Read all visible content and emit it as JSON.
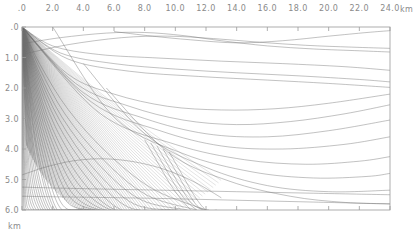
{
  "figure": {
    "title": "",
    "background_color": "#ffffff",
    "frame_color": "#9a9a9a",
    "ray_color": "#6e6e6e"
  },
  "axes": {
    "x_axis": {
      "name": "distance",
      "unit": "km",
      "unit_label": "km",
      "position": "top",
      "min": 0.0,
      "max": 24.0,
      "tick_step": 2.0,
      "tick_labels": [
        ".0",
        "2.0",
        "4.0",
        "6.0",
        "8.0",
        "10.0",
        "12.0",
        "14.0",
        "16.0",
        "18.0",
        "20.0",
        "22.0",
        "24.0"
      ],
      "tick_values": [
        0,
        2,
        4,
        6,
        8,
        10,
        12,
        14,
        16,
        18,
        20,
        22,
        24
      ]
    },
    "y_axis": {
      "name": "depth",
      "unit": "km",
      "unit_label": "km",
      "position": "left",
      "direction": "down",
      "min": 0.0,
      "max": 6.0,
      "tick_step": 1.0,
      "tick_labels": [
        ".0",
        "1.0",
        "2.0",
        "3.0",
        "4.0",
        "5.0",
        "6.0"
      ],
      "tick_values": [
        0,
        1,
        2,
        3,
        4,
        5,
        6
      ]
    }
  },
  "chart_data": {
    "type": "line",
    "title": "",
    "xlabel": "km",
    "ylabel": "km",
    "xlim": [
      0.0,
      24.0
    ],
    "ylim": [
      0.0,
      6.0
    ],
    "y_inverted": true,
    "grid": false,
    "legend": "none",
    "source": {
      "x": 0.0,
      "y": 0.0
    },
    "series": [
      {
        "name": "direct-fan-ray-01",
        "x": [
          0,
          1.2,
          3.0,
          5.5,
          8.5,
          12.0
        ],
        "y": [
          0,
          1.25,
          2.7,
          4.1,
          5.3,
          6.0
        ]
      },
      {
        "name": "direct-fan-ray-02",
        "x": [
          0,
          1.1,
          2.8,
          5.2,
          8.1,
          11.4
        ],
        "y": [
          0,
          1.3,
          2.85,
          4.3,
          5.5,
          6.0
        ]
      },
      {
        "name": "direct-fan-ray-03",
        "x": [
          0,
          1.0,
          2.6,
          4.9,
          7.7,
          10.8
        ],
        "y": [
          0,
          1.35,
          2.95,
          4.45,
          5.65,
          6.0
        ]
      },
      {
        "name": "direct-fan-ray-04",
        "x": [
          0,
          0.95,
          2.45,
          4.6,
          7.3,
          10.2
        ],
        "y": [
          0,
          1.4,
          3.05,
          4.6,
          5.8,
          6.0
        ]
      },
      {
        "name": "direct-fan-ray-05",
        "x": [
          0,
          0.9,
          2.3,
          4.35,
          6.9,
          9.7
        ],
        "y": [
          0,
          1.45,
          3.15,
          4.7,
          5.9,
          6.0
        ]
      },
      {
        "name": "direct-fan-ray-06",
        "x": [
          0,
          0.85,
          2.15,
          4.1,
          6.5,
          9.2
        ],
        "y": [
          0,
          1.5,
          3.25,
          4.85,
          6.0,
          6.0
        ]
      },
      {
        "name": "direct-fan-ray-07",
        "x": [
          0,
          0.8,
          2.0,
          3.85,
          6.1,
          8.7
        ],
        "y": [
          0,
          1.55,
          3.35,
          5.0,
          6.0,
          6.0
        ]
      },
      {
        "name": "direct-fan-ray-08",
        "x": [
          0,
          0.75,
          1.9,
          3.6,
          5.8,
          8.2
        ],
        "y": [
          0,
          1.6,
          3.45,
          5.1,
          6.0,
          6.0
        ]
      },
      {
        "name": "direct-fan-ray-09",
        "x": [
          0,
          0.7,
          1.8,
          3.4,
          5.4,
          7.7
        ],
        "y": [
          0,
          1.65,
          3.55,
          5.25,
          6.0,
          6.0
        ]
      },
      {
        "name": "direct-fan-ray-10",
        "x": [
          0,
          0.65,
          1.7,
          3.2,
          5.1,
          7.2
        ],
        "y": [
          0,
          1.7,
          3.65,
          5.4,
          6.0,
          6.0
        ]
      },
      {
        "name": "direct-fan-ray-11",
        "x": [
          0,
          0.6,
          1.6,
          3.0,
          4.8,
          6.8
        ],
        "y": [
          0,
          1.75,
          3.75,
          5.5,
          6.0,
          6.0
        ]
      },
      {
        "name": "direct-fan-ray-12",
        "x": [
          0,
          0.55,
          1.5,
          2.8,
          4.5,
          6.3
        ],
        "y": [
          0,
          1.8,
          3.85,
          5.65,
          6.0,
          6.0
        ]
      },
      {
        "name": "direct-fan-ray-13",
        "x": [
          0,
          0.5,
          1.4,
          2.6,
          4.2,
          5.9
        ],
        "y": [
          0,
          1.85,
          3.95,
          5.8,
          6.0,
          6.0
        ]
      },
      {
        "name": "direct-fan-ray-14",
        "x": [
          0,
          0.48,
          1.3,
          2.45,
          3.9,
          5.5
        ],
        "y": [
          0,
          1.9,
          4.05,
          5.9,
          6.0,
          6.0
        ]
      },
      {
        "name": "direct-fan-ray-15",
        "x": [
          0,
          0.45,
          1.2,
          2.3,
          3.65,
          5.1
        ],
        "y": [
          0,
          1.95,
          4.15,
          6.0,
          6.0,
          6.0
        ]
      },
      {
        "name": "direct-fan-ray-16",
        "x": [
          0,
          0.42,
          1.1,
          2.15,
          3.4,
          4.8
        ],
        "y": [
          0,
          2.0,
          4.25,
          6.0,
          6.0,
          6.0
        ]
      },
      {
        "name": "direct-fan-ray-17",
        "x": [
          0,
          0.4,
          1.05,
          2.0,
          3.2,
          4.5
        ],
        "y": [
          0,
          2.05,
          4.35,
          6.0,
          6.0,
          6.0
        ]
      },
      {
        "name": "direct-fan-ray-18",
        "x": [
          0,
          0.36,
          0.95,
          1.85,
          2.95,
          4.15
        ],
        "y": [
          0,
          2.1,
          4.5,
          6.0,
          6.0,
          6.0
        ]
      },
      {
        "name": "direct-fan-ray-19",
        "x": [
          0,
          0.33,
          0.88,
          1.7,
          2.7,
          3.85
        ],
        "y": [
          0,
          2.15,
          4.6,
          6.0,
          6.0,
          6.0
        ]
      },
      {
        "name": "direct-fan-ray-20",
        "x": [
          0,
          0.3,
          0.8,
          1.55,
          2.5,
          3.55
        ],
        "y": [
          0,
          2.2,
          4.7,
          6.0,
          6.0,
          6.0
        ]
      },
      {
        "name": "direct-fan-ray-21",
        "x": [
          0,
          0.27,
          0.72,
          1.4,
          2.25,
          3.2
        ],
        "y": [
          0,
          2.25,
          4.8,
          6.0,
          6.0,
          6.0
        ]
      },
      {
        "name": "direct-fan-ray-22",
        "x": [
          0,
          0.24,
          0.64,
          1.25,
          2.0,
          2.85
        ],
        "y": [
          0,
          2.3,
          4.9,
          6.0,
          6.0,
          6.0
        ]
      },
      {
        "name": "direct-fan-ray-23",
        "x": [
          0,
          0.2,
          0.55,
          1.1,
          1.75,
          2.5
        ],
        "y": [
          0,
          2.35,
          5.0,
          6.0,
          6.0,
          6.0
        ]
      },
      {
        "name": "direct-fan-ray-24",
        "x": [
          0,
          0.17,
          0.47,
          0.93,
          1.5,
          2.15
        ],
        "y": [
          0,
          2.4,
          5.1,
          6.0,
          6.0,
          6.0
        ]
      },
      {
        "name": "direct-fan-ray-25",
        "x": [
          0,
          0.14,
          0.39,
          0.78,
          1.25,
          1.8
        ],
        "y": [
          0,
          2.45,
          5.2,
          6.0,
          6.0,
          6.0
        ]
      },
      {
        "name": "direct-fan-ray-26",
        "x": [
          0,
          0.11,
          0.31,
          0.62,
          1.0,
          1.45
        ],
        "y": [
          0,
          2.5,
          5.3,
          6.0,
          6.0,
          6.0
        ]
      },
      {
        "name": "direct-fan-ray-27",
        "x": [
          0,
          0.08,
          0.23,
          0.46,
          0.75,
          1.1
        ],
        "y": [
          0,
          2.55,
          5.4,
          6.0,
          6.0,
          6.0
        ]
      },
      {
        "name": "direct-fan-ray-28",
        "x": [
          0,
          0.06,
          0.17,
          0.34,
          0.55,
          0.8
        ],
        "y": [
          0,
          2.6,
          5.5,
          6.0,
          6.0,
          6.0
        ]
      },
      {
        "name": "direct-fan-ray-29",
        "x": [
          0,
          0.04,
          0.11,
          0.22,
          0.36,
          0.52
        ],
        "y": [
          0,
          2.65,
          5.6,
          6.0,
          6.0,
          6.0
        ]
      },
      {
        "name": "direct-fan-ray-30",
        "x": [
          0,
          0.02,
          0.06,
          0.12,
          0.2,
          0.28
        ],
        "y": [
          0,
          2.7,
          5.7,
          6.0,
          6.0,
          6.0
        ]
      },
      {
        "name": "turning-ray-shallow-01",
        "x": [
          0,
          2.0,
          5.0,
          9.0,
          13.0,
          17.0,
          21.0,
          24.0
        ],
        "y": [
          0,
          0.62,
          0.9,
          1.02,
          1.12,
          1.2,
          1.3,
          1.42
        ]
      },
      {
        "name": "turning-ray-shallow-02",
        "x": [
          0,
          2.5,
          6.0,
          10.0,
          14.0,
          18.0,
          22.0,
          24.0
        ],
        "y": [
          0,
          0.85,
          1.2,
          1.38,
          1.5,
          1.6,
          1.72,
          1.8
        ]
      },
      {
        "name": "turning-ray-shallow-03",
        "x": [
          0,
          3.0,
          7.0,
          11.5,
          16.0,
          20.0,
          24.0
        ],
        "y": [
          0,
          1.05,
          1.45,
          1.62,
          1.74,
          1.85,
          1.98
        ]
      },
      {
        "name": "reflected-arc-01",
        "x": [
          0,
          2.5,
          5.5,
          8.0,
          10.5,
          13.0,
          16.0,
          19.0,
          22.0,
          24.0
        ],
        "y": [
          0.55,
          0.35,
          0.2,
          0.18,
          0.28,
          0.45,
          0.62,
          0.72,
          0.78,
          0.82
        ]
      },
      {
        "name": "reflected-arc-02",
        "x": [
          0,
          3.0,
          6.5,
          9.5,
          12.5,
          15.5,
          18.5,
          21.5,
          24.0
        ],
        "y": [
          0.9,
          0.58,
          0.35,
          0.3,
          0.38,
          0.5,
          0.6,
          0.66,
          0.7
        ]
      },
      {
        "name": "reflected-arc-03",
        "x": [
          6.0,
          8.5,
          11.0,
          14.0,
          17.0,
          20.0,
          22.5,
          24.0
        ],
        "y": [
          0.15,
          0.3,
          0.42,
          0.52,
          0.45,
          0.3,
          0.18,
          0.12
        ]
      },
      {
        "name": "deep-turning-ray-01",
        "x": [
          0,
          3.0,
          6.0,
          9.5,
          13.0,
          16.5,
          20.0,
          24.0
        ],
        "y": [
          0,
          1.55,
          2.2,
          2.6,
          2.72,
          2.68,
          2.5,
          2.2
        ]
      },
      {
        "name": "deep-turning-ray-02",
        "x": [
          0,
          3.5,
          7.0,
          10.5,
          14.0,
          17.5,
          21.0,
          24.0
        ],
        "y": [
          0,
          1.85,
          2.6,
          3.05,
          3.2,
          3.1,
          2.85,
          2.55
        ]
      },
      {
        "name": "deep-turning-ray-03",
        "x": [
          0,
          4.0,
          8.0,
          12.0,
          16.0,
          20.0,
          24.0
        ],
        "y": [
          0,
          2.15,
          3.0,
          3.5,
          3.6,
          3.4,
          3.05
        ]
      },
      {
        "name": "deep-turning-ray-04",
        "x": [
          0,
          4.5,
          9.0,
          13.0,
          17.0,
          21.0,
          24.0
        ],
        "y": [
          0,
          2.45,
          3.4,
          3.9,
          4.0,
          3.85,
          3.6
        ]
      },
      {
        "name": "deep-turning-ray-05",
        "x": [
          0,
          5.0,
          10.0,
          14.5,
          18.5,
          22.0,
          24.0
        ],
        "y": [
          0,
          2.8,
          3.85,
          4.35,
          4.5,
          4.4,
          4.25
        ]
      },
      {
        "name": "deep-turning-ray-06",
        "x": [
          2.0,
          6.0,
          10.5,
          15.0,
          19.0,
          22.5,
          24.0
        ],
        "y": [
          0,
          2.95,
          4.15,
          4.75,
          4.95,
          4.9,
          4.8
        ]
      },
      {
        "name": "deep-turning-ray-07",
        "x": [
          4.0,
          8.0,
          12.0,
          16.0,
          20.0,
          24.0
        ],
        "y": [
          1.2,
          3.5,
          4.6,
          5.2,
          5.4,
          5.35
        ]
      },
      {
        "name": "deep-turning-ray-08",
        "x": [
          5.5,
          9.5,
          13.5,
          17.5,
          21.0,
          24.0
        ],
        "y": [
          2.0,
          4.1,
          5.05,
          5.55,
          5.75,
          5.8
        ]
      },
      {
        "name": "rising-arc-left",
        "x": [
          0,
          1.5,
          3.2,
          5.0,
          6.8,
          8.5,
          10.0,
          11.5,
          13.0
        ],
        "y": [
          4.85,
          4.6,
          4.4,
          4.32,
          4.38,
          4.55,
          4.8,
          5.15,
          5.6
        ]
      },
      {
        "name": "steep-bundle-01",
        "x": [
          8.0,
          8.8,
          9.6,
          10.3,
          11.0
        ],
        "y": [
          3.7,
          4.4,
          5.1,
          5.6,
          6.0
        ]
      },
      {
        "name": "steep-bundle-02",
        "x": [
          8.4,
          9.2,
          10.0,
          10.7,
          11.4
        ],
        "y": [
          3.8,
          4.5,
          5.2,
          5.7,
          6.0
        ]
      },
      {
        "name": "steep-bundle-03",
        "x": [
          8.8,
          9.6,
          10.4,
          11.1,
          11.8
        ],
        "y": [
          3.9,
          4.6,
          5.3,
          5.8,
          6.0
        ]
      },
      {
        "name": "steep-bundle-04",
        "x": [
          9.2,
          10.0,
          10.8,
          11.5,
          12.2
        ],
        "y": [
          4.0,
          4.7,
          5.4,
          5.9,
          6.0
        ]
      },
      {
        "name": "steep-bundle-05",
        "x": [
          9.6,
          10.4,
          11.2,
          12.0,
          12.7
        ],
        "y": [
          4.1,
          4.8,
          5.5,
          6.0,
          6.0
        ]
      },
      {
        "name": "lower-flat-ray-01",
        "x": [
          0,
          4.0,
          9.0,
          14.0,
          19.0,
          24.0
        ],
        "y": [
          5.25,
          5.3,
          5.35,
          5.4,
          5.45,
          5.5
        ]
      },
      {
        "name": "lower-flat-ray-02",
        "x": [
          0,
          4.0,
          9.0,
          14.0,
          19.0,
          24.0
        ],
        "y": [
          5.55,
          5.58,
          5.62,
          5.68,
          5.74,
          5.8
        ]
      }
    ]
  }
}
